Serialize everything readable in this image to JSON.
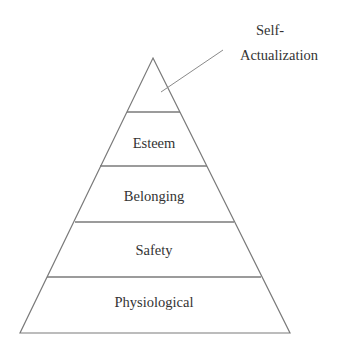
{
  "diagram": {
    "type": "pyramid",
    "colors": {
      "stroke": "#7a7a7a",
      "text": "#333333",
      "background": "#ffffff"
    },
    "levels": [
      {
        "label": "Physiological"
      },
      {
        "label": "Safety"
      },
      {
        "label": "Belonging"
      },
      {
        "label": "Esteem"
      },
      {
        "label": ""
      }
    ],
    "callout": {
      "line1": "Self-",
      "line2": "Actualization"
    }
  }
}
